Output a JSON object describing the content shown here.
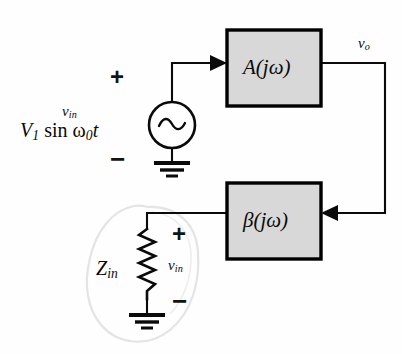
{
  "figure": {
    "kind": "feedback-amplifier-block-diagram",
    "background_color": "#fefefe",
    "ink_color": "#0a0a0a",
    "block_fill_color": "#d8d8d8",
    "block_border_color": "#000000",
    "highlight_outline_color": "#e2e2e2"
  },
  "blocks": {
    "forward": {
      "name": "forward-gain-block",
      "label_main": "A",
      "label_arg": "(jω)",
      "label_full": "A(jω)",
      "x": 227,
      "y": 30,
      "w": 94,
      "h": 76
    },
    "feedback": {
      "name": "feedback-block",
      "label_main": "β",
      "label_arg": "(jω)",
      "label_full": "β(jω)",
      "x": 227,
      "y": 183,
      "w": 94,
      "h": 76
    }
  },
  "source": {
    "symbol": "ac-source-tilde",
    "expression_v1": "V",
    "expression_v1_sub": "1",
    "expression_rest": "sin",
    "expression_omega": "ω",
    "expression_omega_sub": "0",
    "expression_t": "t",
    "expression_full": "V₁ sin ω₀t",
    "input_label": "v",
    "input_label_sub": "in",
    "input_label_full": "v_in",
    "plus": "+",
    "minus": "−"
  },
  "labels": {
    "output_voltage": "v",
    "output_voltage_sub": "o",
    "output_voltage_full": "v_o",
    "impedance": "Z",
    "impedance_sub": "in",
    "impedance_full": "Z_in",
    "feedback_voltage": "v",
    "feedback_voltage_sub": "in",
    "feedback_voltage_full": "v_in",
    "plus": "+",
    "minus": "−"
  },
  "components": {
    "resistor": {
      "name": "input-impedance-resistor",
      "style": "zigzag",
      "peaks": 6,
      "x": 147,
      "y_top": 228,
      "y_bottom": 300
    },
    "ground_source": {
      "name": "ground-symbol-source",
      "x": 172,
      "y": 160
    },
    "ground_zin": {
      "name": "ground-symbol-zin",
      "x": 147,
      "y": 312
    }
  },
  "wires": {
    "source_to_forward": "from AC source top up and right into A(jω) input",
    "forward_to_feedback": "from A(jω) output right, down, left into β(jω) input",
    "feedback_to_zin": "from β(jω) left edge to resistor top node"
  },
  "arrows": [
    {
      "name": "arrow-into-forward-block",
      "direction": "right",
      "x": 218,
      "y": 63
    },
    {
      "name": "arrow-into-feedback-block",
      "direction": "left",
      "x": 330,
      "y": 213
    }
  ]
}
